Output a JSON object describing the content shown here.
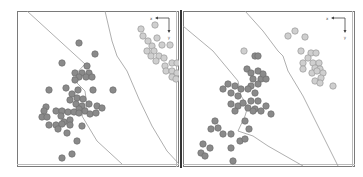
{
  "figure": {
    "panels": 2,
    "colors": {
      "class_dark_fill": "#8a8a8a",
      "class_dark_stroke": "#6f6f6f",
      "class_light_fill": "#cfcfcf",
      "class_light_stroke": "#9a9a9a",
      "boundary": "#9a9a9a",
      "frame": "#7a7a7a",
      "divider": "#333333"
    },
    "axis_indicator": {
      "x_label": "x",
      "y_label": "y"
    }
  },
  "chart_data": [
    {
      "type": "scatter",
      "title": "",
      "xlabel": "x",
      "ylabel": "y",
      "grid": false,
      "legend": "none",
      "note": "Coordinates in panel pixel units (0-160 x, 0-155 y, origin top-left)",
      "series": [
        {
          "name": "dark-class",
          "points": [
            [
              62,
              32
            ],
            [
              78,
              43
            ],
            [
              45,
              52
            ],
            [
              70,
              55
            ],
            [
              58,
              62
            ],
            [
              65,
              62
            ],
            [
              72,
              62
            ],
            [
              62,
              66
            ],
            [
              69,
              66
            ],
            [
              75,
              66
            ],
            [
              58,
              69
            ],
            [
              32,
              79
            ],
            [
              49,
              77
            ],
            [
              61,
              79
            ],
            [
              76,
              79
            ],
            [
              96,
              79
            ],
            [
              55,
              83
            ],
            [
              53,
              89
            ],
            [
              60,
              87
            ],
            [
              66,
              88
            ],
            [
              59,
              93
            ],
            [
              65,
              95
            ],
            [
              72,
              93
            ],
            [
              80,
              95
            ],
            [
              62,
              98
            ],
            [
              68,
              100
            ],
            [
              73,
              103
            ],
            [
              79,
              102
            ],
            [
              85,
              97
            ],
            [
              29,
              96
            ],
            [
              27,
              100
            ],
            [
              39,
              100
            ],
            [
              45,
              100
            ],
            [
              51,
              101
            ],
            [
              57,
              101
            ],
            [
              62,
              102
            ],
            [
              25,
              106
            ],
            [
              30,
              106
            ],
            [
              44,
              105
            ],
            [
              47,
              111
            ],
            [
              53,
              109
            ],
            [
              32,
              114
            ],
            [
              39,
              114
            ],
            [
              45,
              113
            ],
            [
              53,
              114
            ],
            [
              41,
              118
            ],
            [
              65,
              115
            ],
            [
              50,
              122
            ],
            [
              60,
              130
            ],
            [
              55,
              143
            ],
            [
              45,
              147
            ]
          ]
        },
        {
          "name": "light-class",
          "points": [
            [
              124,
              18
            ],
            [
              138,
              14
            ],
            [
              126,
              25
            ],
            [
              131,
              30
            ],
            [
              140,
              27
            ],
            [
              135,
              35
            ],
            [
              145,
              34
            ],
            [
              130,
              40
            ],
            [
              137,
              40
            ],
            [
              142,
              45
            ],
            [
              153,
              34
            ],
            [
              134,
              45
            ],
            [
              139,
              50
            ],
            [
              147,
              47
            ],
            [
              148,
              55
            ],
            [
              155,
              52
            ],
            [
              160,
              52
            ],
            [
              149,
              60
            ],
            [
              155,
              60
            ],
            [
              160,
              62
            ],
            [
              155,
              66
            ],
            [
              159,
              68
            ]
          ]
        }
      ],
      "boundaries": [
        {
          "name": "boundary-left",
          "points": [
            [
              10,
              0
            ],
            [
              68,
              53
            ],
            [
              55,
              67
            ],
            [
              68,
              80
            ],
            [
              70,
              95
            ],
            [
              65,
              105
            ],
            [
              80,
              130
            ],
            [
              105,
              153
            ]
          ]
        },
        {
          "name": "boundary-right",
          "points": [
            [
              88,
              0
            ],
            [
              95,
              30
            ],
            [
              100,
              45
            ],
            [
              110,
              60
            ],
            [
              122,
              88
            ],
            [
              135,
              115
            ],
            [
              150,
              140
            ],
            [
              162,
              153
            ]
          ]
        }
      ]
    },
    {
      "type": "scatter",
      "title": "",
      "xlabel": "x",
      "ylabel": "y",
      "grid": false,
      "legend": "none",
      "note": "Coordinates in panel pixel units (0-170 x, 0-155 y, origin top-left)",
      "series": [
        {
          "name": "dark-class",
          "points": [
            [
              72,
              45
            ],
            [
              75,
              45
            ],
            [
              64,
              58
            ],
            [
              68,
              62
            ],
            [
              75,
              60
            ],
            [
              70,
              68
            ],
            [
              78,
              68
            ],
            [
              68,
              75
            ],
            [
              75,
              73
            ],
            [
              83,
              68
            ],
            [
              80,
              63
            ],
            [
              40,
              78
            ],
            [
              45,
              73
            ],
            [
              52,
              75
            ],
            [
              58,
              78
            ],
            [
              48,
              82
            ],
            [
              55,
              85
            ],
            [
              65,
              78
            ],
            [
              72,
              82
            ],
            [
              68,
              90
            ],
            [
              75,
              90
            ],
            [
              48,
              93
            ],
            [
              55,
              95
            ],
            [
              60,
              92
            ],
            [
              52,
              100
            ],
            [
              65,
              97
            ],
            [
              72,
              98
            ],
            [
              78,
              100
            ],
            [
              83,
              95
            ],
            [
              88,
              103
            ],
            [
              70,
              100
            ],
            [
              32,
              110
            ],
            [
              28,
              118
            ],
            [
              35,
              117
            ],
            [
              40,
              123
            ],
            [
              48,
              123
            ],
            [
              62,
              110
            ],
            [
              66,
              118
            ],
            [
              20,
              133
            ],
            [
              27,
              137
            ],
            [
              18,
              142
            ],
            [
              22,
              145
            ],
            [
              48,
              137
            ],
            [
              57,
              130
            ],
            [
              62,
              128
            ],
            [
              50,
              150
            ]
          ]
        },
        {
          "name": "light-class",
          "points": [
            [
              105,
              25
            ],
            [
              112,
              20
            ],
            [
              122,
              26
            ],
            [
              118,
              40
            ],
            [
              128,
              42
            ],
            [
              133,
              42
            ],
            [
              125,
              47
            ],
            [
              130,
              52
            ],
            [
              136,
              52
            ],
            [
              120,
              52
            ],
            [
              120,
              58
            ],
            [
              132,
              57
            ],
            [
              137,
              58
            ],
            [
              129,
              62
            ],
            [
              134,
              60
            ],
            [
              140,
              62
            ],
            [
              138,
              67
            ],
            [
              132,
              70
            ],
            [
              137,
              72
            ],
            [
              150,
              75
            ],
            [
              61,
              40
            ]
          ]
        }
      ],
      "boundaries": [
        {
          "name": "boundary-left",
          "points": [
            [
              0,
              15
            ],
            [
              30,
              40
            ],
            [
              55,
              70
            ],
            [
              58,
              85
            ],
            [
              65,
              95
            ],
            [
              62,
              105
            ],
            [
              55,
              120
            ],
            [
              70,
              125
            ],
            [
              85,
              135
            ],
            [
              120,
              155
            ]
          ]
        },
        {
          "name": "boundary-right",
          "points": [
            [
              62,
              0
            ],
            [
              80,
              20
            ],
            [
              95,
              40
            ],
            [
              100,
              45
            ],
            [
              105,
              60
            ],
            [
              120,
              85
            ],
            [
              130,
              105
            ],
            [
              140,
              125
            ],
            [
              155,
              155
            ]
          ]
        }
      ]
    }
  ]
}
